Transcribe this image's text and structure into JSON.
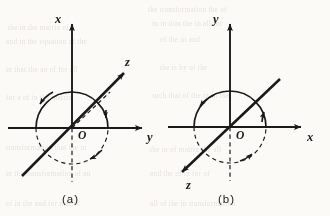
{
  "figure": {
    "background_color": "#fbfaf7",
    "ink_color": "#1a1a1a",
    "panels": [
      {
        "id": "panel-a",
        "caption": "(a)",
        "origin_label": "O",
        "center": {
          "x": 72,
          "y": 128
        },
        "circle_radius": 36,
        "axes": [
          {
            "name": "x",
            "label": "x",
            "direction": "up",
            "style": "solid",
            "tip": {
              "x": 72,
              "y": 20
            },
            "label_pos": {
              "x": 59,
              "y": 19
            }
          },
          {
            "name": "y",
            "label": "y",
            "direction": "right",
            "style": "solid",
            "tip": {
              "x": 146,
              "y": 128
            },
            "label_pos": {
              "x": 150,
              "y": 139
            }
          },
          {
            "name": "z",
            "label": "z",
            "direction": "up-right-oblique",
            "style": "solid",
            "tip": {
              "x": 127,
              "y": 70
            },
            "label_pos": {
              "x": 129,
              "y": 63
            }
          }
        ],
        "dashed_elements": [
          {
            "name": "negative-x-axis",
            "from": {
              "x": 72,
              "y": 128
            },
            "to": {
              "x": 72,
              "y": 182
            }
          },
          {
            "name": "negative-z-axis",
            "from": {
              "x": 72,
              "y": 128
            },
            "to": {
              "x": 109,
              "y": 95
            }
          },
          {
            "name": "circle-rear-arc",
            "arc": "left-lower-and-right-lower"
          }
        ],
        "rotation_arrows": [
          {
            "name": "rotation-arrow-upper-left",
            "on": "solid-arc",
            "at": {
              "x": 43,
              "y": 97
            }
          },
          {
            "name": "rotation-arrow-right",
            "on": "solid-arc",
            "at": {
              "x": 104,
              "y": 113
            }
          },
          {
            "name": "rotation-arrow-lower",
            "on": "dashed-arc",
            "at": {
              "x": 92,
              "y": 158
            }
          }
        ]
      },
      {
        "id": "panel-b",
        "caption": "(b)",
        "origin_label": "O",
        "center": {
          "x": 230,
          "y": 127
        },
        "circle_radius": 36,
        "axes": [
          {
            "name": "y",
            "label": "y",
            "direction": "up",
            "style": "solid",
            "tip": {
              "x": 230,
              "y": 20
            },
            "label_pos": {
              "x": 217,
              "y": 19
            }
          },
          {
            "name": "x",
            "label": "x",
            "direction": "right",
            "style": "solid",
            "tip": {
              "x": 305,
              "y": 127
            },
            "label_pos": {
              "x": 310,
              "y": 139
            }
          },
          {
            "name": "z",
            "label": "z",
            "direction": "down-left-oblique",
            "style": "solid",
            "tip": {
              "x": 180,
              "y": 173
            },
            "label_pos": {
              "x": 190,
              "y": 185
            }
          }
        ],
        "dashed_elements": [
          {
            "name": "negative-y-axis",
            "from": {
              "x": 230,
              "y": 127
            },
            "to": {
              "x": 230,
              "y": 181
            }
          },
          {
            "name": "negative-z-axis",
            "from": {
              "x": 230,
              "y": 127
            },
            "to": {
              "x": 266,
              "y": 94
            }
          },
          {
            "name": "circle-rear-arc",
            "arc": "left-lower-and-right-lower"
          }
        ],
        "rotation_arrows": [
          {
            "name": "rotation-arrow-upper-left",
            "on": "solid-arc",
            "at": {
              "x": 202,
              "y": 101
            }
          },
          {
            "name": "rotation-arrow-right",
            "on": "solid-arc",
            "at": {
              "x": 264,
              "y": 114
            }
          },
          {
            "name": "rotation-arrow-lower",
            "on": "dashed-arc",
            "at": {
              "x": 250,
              "y": 157
            }
          }
        ]
      }
    ],
    "showthrough_text": [
      "the transformation the of",
      "in in tion the in all for",
      "the in the matrix of",
      "and in the equation of the",
      "of the in and",
      "in that the an of for all",
      "the is by of the",
      "for a of in the matrix",
      "such that of the in in the",
      "transformation that the in"
    ]
  }
}
